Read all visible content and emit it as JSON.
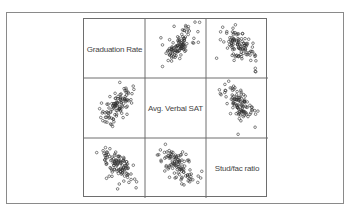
{
  "chart_data": {
    "type": "scatter",
    "subtype": "scatterplot-matrix",
    "variables": [
      "Graduation Rate",
      "Avg. Verbal SAT",
      "Stud/fac ratio"
    ],
    "diagonal_labels": [
      "Graduation Rate",
      "Avg. Verbal SAT",
      "Stud/fac ratio"
    ],
    "grid": false,
    "axes_ticks": false,
    "panels": [
      {
        "row": 0,
        "col": 1,
        "x": "Avg. Verbal SAT",
        "y": "Graduation Rate",
        "relationship": "positive"
      },
      {
        "row": 0,
        "col": 2,
        "x": "Stud/fac ratio",
        "y": "Graduation Rate",
        "relationship": "negative"
      },
      {
        "row": 1,
        "col": 0,
        "x": "Graduation Rate",
        "y": "Avg. Verbal SAT",
        "relationship": "positive"
      },
      {
        "row": 1,
        "col": 2,
        "x": "Stud/fac ratio",
        "y": "Avg. Verbal SAT",
        "relationship": "negative"
      },
      {
        "row": 2,
        "col": 0,
        "x": "Graduation Rate",
        "y": "Stud/fac ratio",
        "relationship": "negative"
      },
      {
        "row": 2,
        "col": 1,
        "x": "Avg. Verbal SAT",
        "y": "Stud/fac ratio",
        "relationship": "negative"
      }
    ],
    "marker": "open-circle",
    "marker_color": "#333333"
  },
  "labels": {
    "graduation_rate": "Graduation Rate",
    "avg_verbal_sat": "Avg. Verbal SAT",
    "stud_fac_ratio": "Stud/fac ratio"
  }
}
